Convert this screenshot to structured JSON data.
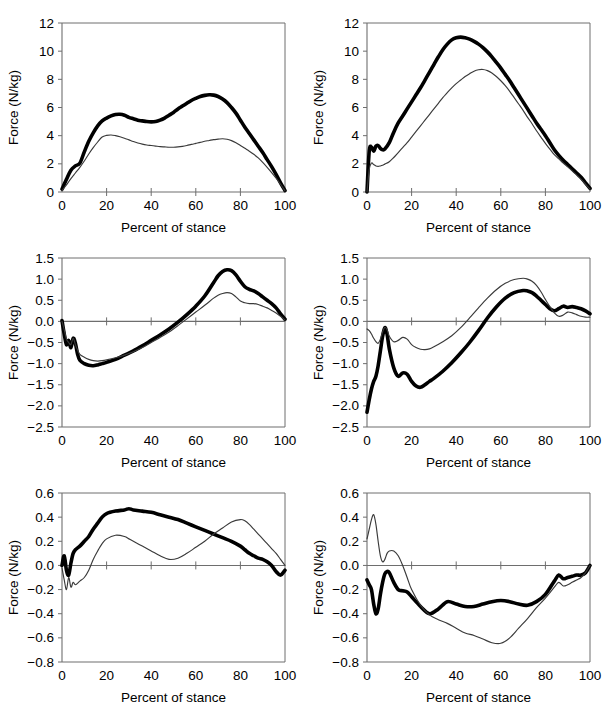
{
  "figure": {
    "panel_count": 6,
    "rows": 3,
    "cols": 2
  },
  "axis": {
    "xlabel": "Percent of stance",
    "ylabel": "Force (N/kg)"
  },
  "chart_data": [
    {
      "id": "top-left",
      "type": "line",
      "title": "",
      "xlabel": "Percent of stance",
      "ylabel": "Force (N/kg)",
      "xlim": [
        0,
        100
      ],
      "ylim": [
        0,
        12
      ],
      "xticks": [
        0,
        20,
        40,
        60,
        80,
        100
      ],
      "yticks": [
        0,
        2,
        4,
        6,
        8,
        10,
        12
      ],
      "grid": false,
      "legend": "none",
      "x": [
        0,
        2,
        4,
        6,
        8,
        10,
        12,
        14,
        16,
        18,
        20,
        22,
        24,
        26,
        28,
        30,
        32,
        34,
        36,
        38,
        40,
        42,
        44,
        46,
        48,
        50,
        52,
        54,
        56,
        58,
        60,
        62,
        64,
        66,
        68,
        70,
        72,
        74,
        76,
        78,
        80,
        82,
        84,
        86,
        88,
        90,
        92,
        94,
        96,
        98,
        100
      ],
      "series": [
        {
          "name": "thick",
          "style": "thick-black",
          "values": [
            0.2,
            0.9,
            1.55,
            1.85,
            2.05,
            2.85,
            3.6,
            4.2,
            4.7,
            5.05,
            5.25,
            5.4,
            5.5,
            5.52,
            5.45,
            5.3,
            5.2,
            5.1,
            5.05,
            5.0,
            4.98,
            5.0,
            5.1,
            5.25,
            5.45,
            5.65,
            5.9,
            6.1,
            6.3,
            6.5,
            6.65,
            6.78,
            6.86,
            6.9,
            6.88,
            6.78,
            6.6,
            6.35,
            6.0,
            5.6,
            5.1,
            4.6,
            4.15,
            3.7,
            3.25,
            2.8,
            2.3,
            1.8,
            1.25,
            0.65,
            0.1
          ]
        },
        {
          "name": "thin",
          "style": "thin-black",
          "values": [
            0.1,
            0.5,
            0.95,
            1.35,
            1.75,
            2.2,
            2.7,
            3.15,
            3.55,
            3.9,
            4.02,
            4.05,
            4.0,
            3.92,
            3.82,
            3.7,
            3.58,
            3.48,
            3.4,
            3.34,
            3.3,
            3.26,
            3.22,
            3.2,
            3.18,
            3.18,
            3.2,
            3.24,
            3.3,
            3.38,
            3.45,
            3.52,
            3.6,
            3.66,
            3.72,
            3.75,
            3.78,
            3.75,
            3.65,
            3.5,
            3.3,
            3.1,
            2.9,
            2.68,
            2.42,
            2.1,
            1.75,
            1.38,
            0.98,
            0.55,
            0.08
          ]
        }
      ]
    },
    {
      "id": "top-right",
      "type": "line",
      "title": "",
      "xlabel": "Percent of stance",
      "ylabel": "Force (N/kg)",
      "xlim": [
        0,
        100
      ],
      "ylim": [
        0,
        12
      ],
      "xticks": [
        0,
        20,
        40,
        60,
        80,
        100
      ],
      "yticks": [
        0,
        2,
        4,
        6,
        8,
        10,
        12
      ],
      "grid": false,
      "legend": "none",
      "x": [
        0,
        1,
        2,
        3,
        4,
        5,
        6,
        7,
        8,
        10,
        12,
        14,
        16,
        18,
        20,
        22,
        24,
        26,
        28,
        30,
        32,
        34,
        36,
        38,
        40,
        42,
        44,
        46,
        48,
        50,
        52,
        54,
        56,
        58,
        60,
        62,
        64,
        66,
        68,
        70,
        72,
        74,
        76,
        78,
        80,
        82,
        84,
        86,
        88,
        90,
        92,
        94,
        96,
        98,
        100
      ],
      "series": [
        {
          "name": "thick",
          "style": "thick-black",
          "values": [
            0.0,
            2.9,
            3.2,
            2.9,
            3.25,
            3.3,
            3.1,
            3.0,
            3.05,
            3.5,
            4.25,
            4.9,
            5.4,
            5.9,
            6.4,
            6.9,
            7.4,
            7.95,
            8.5,
            9.05,
            9.6,
            10.1,
            10.5,
            10.8,
            10.95,
            11.0,
            10.95,
            10.85,
            10.7,
            10.5,
            10.25,
            9.95,
            9.6,
            9.2,
            8.8,
            8.35,
            7.9,
            7.4,
            6.9,
            6.4,
            5.9,
            5.4,
            4.9,
            4.45,
            4.0,
            3.5,
            3.0,
            2.6,
            2.25,
            1.95,
            1.65,
            1.35,
            1.05,
            0.65,
            0.25
          ]
        },
        {
          "name": "thin",
          "style": "thin-black",
          "values": [
            0.0,
            1.6,
            2.05,
            1.95,
            1.85,
            1.82,
            1.85,
            1.9,
            1.98,
            2.15,
            2.45,
            2.8,
            3.15,
            3.5,
            3.9,
            4.3,
            4.7,
            5.1,
            5.5,
            5.9,
            6.3,
            6.7,
            7.05,
            7.4,
            7.7,
            7.95,
            8.2,
            8.4,
            8.58,
            8.68,
            8.7,
            8.62,
            8.45,
            8.2,
            7.9,
            7.55,
            7.15,
            6.7,
            6.25,
            5.8,
            5.3,
            4.85,
            4.35,
            3.9,
            3.45,
            3.05,
            2.65,
            2.35,
            2.05,
            1.78,
            1.5,
            1.2,
            0.9,
            0.55,
            0.2
          ]
        }
      ]
    },
    {
      "id": "middle-left",
      "type": "line",
      "title": "",
      "xlabel": "Percent of stance",
      "ylabel": "Force (N/kg)",
      "xlim": [
        0,
        100
      ],
      "ylim": [
        -2.5,
        1.5
      ],
      "xticks": [
        0,
        20,
        40,
        60,
        80,
        100
      ],
      "yticks": [
        -2.5,
        -2.0,
        -1.5,
        -1.0,
        -0.5,
        0.0,
        0.5,
        1.0,
        1.5
      ],
      "grid": false,
      "legend": "none",
      "x": [
        0,
        1,
        2,
        3,
        4,
        5,
        6,
        7,
        8,
        10,
        12,
        14,
        16,
        18,
        20,
        24,
        28,
        32,
        36,
        40,
        44,
        48,
        52,
        56,
        60,
        64,
        68,
        70,
        72,
        74,
        76,
        78,
        80,
        82,
        84,
        86,
        88,
        90,
        92,
        94,
        96,
        98,
        100
      ],
      "series": [
        {
          "name": "thick",
          "style": "thick-black",
          "values": [
            0.02,
            -0.3,
            -0.55,
            -0.45,
            -0.62,
            -0.4,
            -0.52,
            -0.78,
            -0.92,
            -1.0,
            -1.04,
            -1.05,
            -1.03,
            -1.0,
            -0.97,
            -0.9,
            -0.8,
            -0.7,
            -0.58,
            -0.45,
            -0.32,
            -0.18,
            -0.02,
            0.16,
            0.36,
            0.6,
            0.92,
            1.08,
            1.18,
            1.22,
            1.2,
            1.1,
            0.95,
            0.82,
            0.76,
            0.72,
            0.66,
            0.58,
            0.5,
            0.42,
            0.32,
            0.18,
            0.05
          ]
        },
        {
          "name": "thin",
          "style": "thin-black",
          "values": [
            0.0,
            -0.2,
            -0.42,
            -0.5,
            -0.55,
            -0.4,
            -0.55,
            -0.68,
            -0.78,
            -0.85,
            -0.9,
            -0.93,
            -0.94,
            -0.93,
            -0.91,
            -0.86,
            -0.8,
            -0.72,
            -0.62,
            -0.5,
            -0.38,
            -0.25,
            -0.1,
            0.06,
            0.22,
            0.38,
            0.55,
            0.62,
            0.66,
            0.68,
            0.66,
            0.58,
            0.48,
            0.44,
            0.42,
            0.42,
            0.4,
            0.36,
            0.32,
            0.26,
            0.2,
            0.12,
            0.03
          ]
        }
      ]
    },
    {
      "id": "middle-right",
      "type": "line",
      "title": "",
      "xlabel": "Percent of stance",
      "ylabel": "Force (N/kg)",
      "xlim": [
        0,
        100
      ],
      "ylim": [
        -2.5,
        1.5
      ],
      "xticks": [
        0,
        20,
        40,
        60,
        80,
        100
      ],
      "yticks": [
        -2.5,
        -2.0,
        -1.5,
        -1.0,
        -0.5,
        0.0,
        0.5,
        1.0,
        1.5
      ],
      "grid": false,
      "legend": "none",
      "x": [
        0,
        1,
        2,
        3,
        4,
        5,
        6,
        7,
        8,
        9,
        10,
        12,
        14,
        16,
        18,
        20,
        22,
        24,
        26,
        28,
        30,
        34,
        38,
        42,
        46,
        50,
        54,
        58,
        62,
        66,
        70,
        72,
        74,
        76,
        78,
        80,
        82,
        84,
        86,
        88,
        90,
        92,
        94,
        96,
        98,
        100
      ],
      "series": [
        {
          "name": "thick",
          "style": "thick-black",
          "values": [
            -2.15,
            -1.85,
            -1.6,
            -1.42,
            -1.3,
            -1.05,
            -0.7,
            -0.35,
            -0.15,
            -0.3,
            -0.65,
            -1.1,
            -1.3,
            -1.22,
            -1.25,
            -1.42,
            -1.53,
            -1.56,
            -1.5,
            -1.42,
            -1.35,
            -1.18,
            -0.98,
            -0.75,
            -0.5,
            -0.22,
            0.08,
            0.34,
            0.55,
            0.68,
            0.73,
            0.72,
            0.68,
            0.6,
            0.5,
            0.4,
            0.3,
            0.25,
            0.3,
            0.36,
            0.33,
            0.35,
            0.33,
            0.3,
            0.25,
            0.18
          ]
        },
        {
          "name": "thin",
          "style": "thin-black",
          "values": [
            -0.18,
            -0.22,
            -0.3,
            -0.4,
            -0.48,
            -0.52,
            -0.42,
            -0.25,
            -0.14,
            -0.2,
            -0.35,
            -0.48,
            -0.45,
            -0.38,
            -0.42,
            -0.55,
            -0.62,
            -0.66,
            -0.67,
            -0.65,
            -0.6,
            -0.48,
            -0.34,
            -0.15,
            0.08,
            0.32,
            0.55,
            0.75,
            0.9,
            0.99,
            1.02,
            1.0,
            0.95,
            0.85,
            0.7,
            0.52,
            0.35,
            0.2,
            0.12,
            0.15,
            0.22,
            0.2,
            0.16,
            0.12,
            0.1,
            0.1
          ]
        }
      ]
    },
    {
      "id": "bottom-left",
      "type": "line",
      "title": "",
      "xlabel": "Percent of stance",
      "ylabel": "Force (N/kg)",
      "xlim": [
        0,
        100
      ],
      "ylim": [
        -0.8,
        0.6
      ],
      "xticks": [
        0,
        20,
        40,
        60,
        80,
        100
      ],
      "yticks": [
        -0.8,
        -0.6,
        -0.4,
        -0.2,
        0.0,
        0.2,
        0.4,
        0.6
      ],
      "grid": false,
      "legend": "none",
      "x": [
        0,
        1,
        2,
        3,
        4,
        5,
        6,
        8,
        10,
        12,
        14,
        16,
        18,
        20,
        24,
        28,
        30,
        32,
        36,
        40,
        44,
        48,
        52,
        56,
        60,
        64,
        68,
        72,
        76,
        80,
        82,
        84,
        86,
        88,
        90,
        92,
        94,
        96,
        98,
        100
      ],
      "series": [
        {
          "name": "thick",
          "style": "thick-black",
          "values": [
            0.0,
            0.08,
            -0.04,
            -0.08,
            0.02,
            0.1,
            0.13,
            0.16,
            0.2,
            0.24,
            0.3,
            0.35,
            0.4,
            0.43,
            0.45,
            0.46,
            0.47,
            0.46,
            0.45,
            0.44,
            0.42,
            0.4,
            0.38,
            0.35,
            0.32,
            0.29,
            0.26,
            0.23,
            0.2,
            0.16,
            0.13,
            0.1,
            0.08,
            0.06,
            0.05,
            0.03,
            0.0,
            -0.05,
            -0.08,
            -0.04
          ]
        },
        {
          "name": "thin",
          "style": "thin-black",
          "values": [
            -0.02,
            -0.12,
            -0.2,
            -0.1,
            -0.18,
            -0.14,
            -0.16,
            -0.13,
            -0.1,
            -0.04,
            0.05,
            0.12,
            0.18,
            0.22,
            0.25,
            0.24,
            0.22,
            0.2,
            0.16,
            0.12,
            0.08,
            0.05,
            0.06,
            0.1,
            0.15,
            0.2,
            0.26,
            0.31,
            0.36,
            0.38,
            0.37,
            0.34,
            0.3,
            0.26,
            0.22,
            0.18,
            0.14,
            0.1,
            0.05,
            0.0
          ]
        }
      ]
    },
    {
      "id": "bottom-right",
      "type": "line",
      "title": "",
      "xlabel": "Percent of stance",
      "ylabel": "Force (N/kg)",
      "xlim": [
        0,
        100
      ],
      "ylim": [
        -0.8,
        0.6
      ],
      "xticks": [
        0,
        20,
        40,
        60,
        80,
        100
      ],
      "yticks": [
        -0.8,
        -0.6,
        -0.4,
        -0.2,
        0.0,
        0.2,
        0.4,
        0.6
      ],
      "grid": false,
      "legend": "none",
      "x": [
        0,
        1,
        2,
        3,
        4,
        5,
        6,
        7,
        8,
        9,
        10,
        12,
        14,
        16,
        18,
        20,
        24,
        28,
        32,
        36,
        40,
        44,
        48,
        52,
        56,
        60,
        64,
        68,
        72,
        76,
        80,
        84,
        86,
        88,
        90,
        92,
        94,
        96,
        98,
        100
      ],
      "series": [
        {
          "name": "thick",
          "style": "thick-black",
          "values": [
            -0.12,
            -0.16,
            -0.2,
            -0.32,
            -0.4,
            -0.36,
            -0.24,
            -0.14,
            -0.07,
            -0.05,
            -0.06,
            -0.14,
            -0.2,
            -0.21,
            -0.22,
            -0.26,
            -0.34,
            -0.4,
            -0.36,
            -0.3,
            -0.32,
            -0.34,
            -0.34,
            -0.32,
            -0.3,
            -0.29,
            -0.3,
            -0.32,
            -0.33,
            -0.3,
            -0.24,
            -0.13,
            -0.08,
            -0.11,
            -0.1,
            -0.09,
            -0.08,
            -0.08,
            -0.06,
            0.0
          ]
        },
        {
          "name": "thin",
          "style": "thin-black",
          "values": [
            0.22,
            0.3,
            0.38,
            0.42,
            0.34,
            0.2,
            0.08,
            0.03,
            0.05,
            0.1,
            0.12,
            0.12,
            0.08,
            0.0,
            -0.1,
            -0.2,
            -0.33,
            -0.41,
            -0.45,
            -0.48,
            -0.52,
            -0.56,
            -0.58,
            -0.61,
            -0.64,
            -0.645,
            -0.6,
            -0.52,
            -0.44,
            -0.35,
            -0.27,
            -0.18,
            -0.14,
            -0.17,
            -0.16,
            -0.14,
            -0.12,
            -0.1,
            -0.06,
            0.0
          ]
        }
      ]
    }
  ]
}
